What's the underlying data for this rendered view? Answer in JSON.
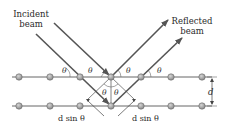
{
  "diagram": {
    "type": "bragg-diffraction",
    "incident_label_line1": "Incident",
    "incident_label_line2": "beam",
    "reflected_label_line1": "Reflected",
    "reflected_label_line2": "beam",
    "theta": "θ",
    "spacing_label": "d",
    "path_diff_left": "d sin θ",
    "path_diff_right": "d sin θ",
    "colors": {
      "beam": "#555555",
      "plane": "#666666",
      "atom_fill": "#a8a8a8",
      "atom_stroke": "#6a6a6a",
      "text": "#2a2a2a"
    },
    "planes": [
      {
        "y": 77,
        "atoms_x": [
          19,
          50,
          80,
          111,
          141,
          171,
          202
        ]
      },
      {
        "y": 106,
        "atoms_x": [
          19,
          50,
          80,
          111,
          141,
          171,
          202
        ]
      }
    ]
  }
}
